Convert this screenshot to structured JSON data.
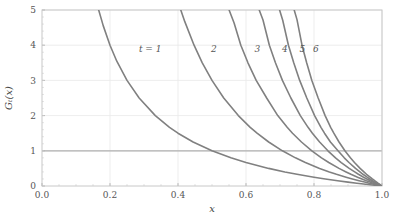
{
  "chart_data": {
    "type": "line",
    "title": "",
    "xlabel": "x",
    "ylabel": "Gₜ(x)",
    "xlim": [
      0.0,
      1.0
    ],
    "ylim": [
      0,
      5
    ],
    "xticks": [
      "0.0",
      "0.2",
      "0.4",
      "0.6",
      "0.8",
      "1.0"
    ],
    "xtick_values": [
      0.0,
      0.2,
      0.4,
      0.6,
      0.8,
      1.0
    ],
    "yticks": [
      "0",
      "1",
      "2",
      "3",
      "4",
      "5"
    ],
    "ytick_values": [
      0,
      1,
      2,
      3,
      4,
      5
    ],
    "grid": true,
    "legend_position": "inline-annotations",
    "line_color": "#808080",
    "grid_color": "#e8e8e8",
    "reference_line_color": "#b0b0b0",
    "frame_color": "#c8c8c8",
    "reference_line": {
      "axis": "y",
      "value": 1,
      "label": ""
    },
    "annotations": [
      {
        "text": "t = 1",
        "x": 0.285,
        "y": 3.82
      },
      {
        "text": "2",
        "x": 0.497,
        "y": 3.82
      },
      {
        "text": "3",
        "x": 0.625,
        "y": 3.82
      },
      {
        "text": "4",
        "x": 0.706,
        "y": 3.82
      },
      {
        "text": "5",
        "x": 0.757,
        "y": 3.82
      },
      {
        "text": "6",
        "x": 0.797,
        "y": 3.82
      }
    ],
    "series": [
      {
        "name": "t = 1",
        "label": "t = 1",
        "x": [
          0.1667,
          0.18,
          0.2,
          0.22,
          0.25,
          0.2857,
          0.3333,
          0.375,
          0.4,
          0.4444,
          0.5,
          0.5556,
          0.6,
          0.6667,
          0.7143,
          0.75,
          0.8,
          0.8333,
          0.8696,
          0.9,
          0.9259,
          0.9524,
          0.9709,
          0.9804,
          0.99,
          1.0
        ],
        "y": [
          5.0,
          4.556,
          4.0,
          3.545,
          3.0,
          2.5,
          2.0,
          1.667,
          1.5,
          1.25,
          1.0,
          0.8,
          0.667,
          0.5,
          0.4,
          0.333,
          0.25,
          0.2,
          0.15,
          0.111,
          0.08,
          0.05,
          0.03,
          0.02,
          0.0101,
          0.0
        ]
      },
      {
        "name": "t = 2",
        "label": "2",
        "x": [
          0.4082,
          0.42,
          0.4472,
          0.4714,
          0.5,
          0.5345,
          0.5774,
          0.6124,
          0.6325,
          0.6667,
          0.7071,
          0.7454,
          0.7746,
          0.8165,
          0.8452,
          0.866,
          0.8944,
          0.9129,
          0.9325,
          0.9487,
          0.9623,
          0.9759,
          0.9853,
          0.9901,
          0.995,
          1.0
        ],
        "y": [
          5.0,
          4.669,
          4.0,
          3.5,
          3.0,
          2.5,
          2.0,
          1.667,
          1.5,
          1.25,
          1.0,
          0.8,
          0.667,
          0.5,
          0.4,
          0.333,
          0.25,
          0.2,
          0.15,
          0.111,
          0.08,
          0.05,
          0.03,
          0.02,
          0.0101,
          0.0
        ]
      },
      {
        "name": "t = 3",
        "label": "3",
        "x": [
          0.5503,
          0.565,
          0.5848,
          0.6057,
          0.63,
          0.6608,
          0.6934,
          0.7211,
          0.7368,
          0.7631,
          0.7937,
          0.8221,
          0.8434,
          0.8736,
          0.8944,
          0.9086,
          0.9283,
          0.941,
          0.954,
          0.965,
          0.974,
          0.9835,
          0.9899,
          0.9933,
          0.9967,
          1.0
        ],
        "y": [
          5.0,
          4.629,
          4.0,
          3.5,
          3.0,
          2.5,
          2.0,
          1.667,
          1.5,
          1.25,
          1.0,
          0.8,
          0.667,
          0.5,
          0.4,
          0.333,
          0.25,
          0.2,
          0.15,
          0.111,
          0.08,
          0.05,
          0.03,
          0.02,
          0.0101,
          0.0
        ]
      },
      {
        "name": "t = 4",
        "label": "4",
        "x": [
          0.6389,
          0.65,
          0.6687,
          0.6866,
          0.7071,
          0.732,
          0.7598,
          0.7825,
          0.7953,
          0.8165,
          0.8409,
          0.8633,
          0.8801,
          0.9036,
          0.9197,
          0.9306,
          0.9457,
          0.9554,
          0.9653,
          0.9736,
          0.9804,
          0.9876,
          0.9925,
          0.995,
          0.9975,
          1.0
        ],
        "y": [
          5.0,
          4.715,
          4.0,
          3.5,
          3.0,
          2.5,
          2.0,
          1.667,
          1.5,
          1.25,
          1.0,
          0.8,
          0.667,
          0.5,
          0.4,
          0.333,
          0.25,
          0.2,
          0.15,
          0.111,
          0.08,
          0.05,
          0.03,
          0.02,
          0.0101,
          0.0
        ]
      },
      {
        "name": "t = 5",
        "label": "5",
        "x": [
          0.6988,
          0.708,
          0.7248,
          0.7404,
          0.7579,
          0.7788,
          0.8018,
          0.8204,
          0.8309,
          0.8483,
          0.8706,
          0.889,
          0.9028,
          0.9221,
          0.9351,
          0.944,
          0.9563,
          0.9641,
          0.9722,
          0.9789,
          0.9843,
          0.9901,
          0.994,
          0.996,
          0.998,
          1.0
        ],
        "y": [
          5.0,
          4.709,
          4.0,
          3.5,
          3.0,
          2.5,
          2.0,
          1.667,
          1.5,
          1.25,
          1.0,
          0.8,
          0.667,
          0.5,
          0.4,
          0.333,
          0.25,
          0.2,
          0.15,
          0.111,
          0.08,
          0.05,
          0.03,
          0.02,
          0.0101,
          0.0
        ]
      },
      {
        "name": "t = 6",
        "label": "6",
        "x": [
          0.7418,
          0.75,
          0.7647,
          0.7784,
          0.7937,
          0.8123,
          0.8327,
          0.849,
          0.8583,
          0.8736,
          0.8909,
          0.907,
          0.919,
          0.9356,
          0.9467,
          0.9544,
          0.965,
          0.9716,
          0.9785,
          0.9842,
          0.9881,
          0.9925,
          0.9955,
          0.997,
          0.9985,
          1.0
        ],
        "y": [
          5.0,
          4.726,
          4.0,
          3.5,
          3.0,
          2.5,
          2.0,
          1.667,
          1.5,
          1.25,
          1.0,
          0.8,
          0.667,
          0.5,
          0.4,
          0.333,
          0.25,
          0.2,
          0.15,
          0.111,
          0.08,
          0.05,
          0.03,
          0.02,
          0.0101,
          0.0
        ]
      }
    ]
  },
  "figure": {
    "background_color": "#ffffff",
    "plot_area": {
      "left": 42,
      "top": 10,
      "right": 382,
      "bottom": 186
    }
  }
}
